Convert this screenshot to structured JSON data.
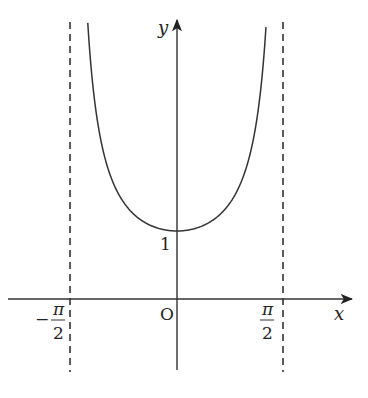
{
  "chart_data": {
    "type": "line",
    "title": "",
    "function": "y = 1/cos(x)",
    "xlabel": "x",
    "ylabel": "y",
    "origin_label": "O",
    "x_ticks": [
      {
        "value": -1.5708,
        "label_num": "π",
        "label_den": "2",
        "sign": "−"
      },
      {
        "value": 1.5708,
        "label_num": "π",
        "label_den": "2",
        "sign": ""
      }
    ],
    "y_ticks": [
      {
        "value": 1,
        "label": "1"
      }
    ],
    "asymptotes": [
      -1.5708,
      1.5708
    ],
    "xlim": [
      -2.5,
      2.6
    ],
    "ylim": [
      -1.05,
      4.1
    ],
    "grid": false,
    "legend": "none",
    "series": [
      {
        "name": "sec x",
        "x": [
          -1.32,
          -1.2,
          -1.0,
          -0.8,
          -0.6,
          -0.4,
          -0.2,
          0,
          0.2,
          0.4,
          0.6,
          0.8,
          1.0,
          1.2,
          1.32
        ],
        "y": [
          4.07,
          2.76,
          1.85,
          1.44,
          1.21,
          1.09,
          1.02,
          1.0,
          1.02,
          1.09,
          1.21,
          1.44,
          1.85,
          2.76,
          4.07
        ]
      }
    ]
  },
  "labels": {
    "x_axis": "x",
    "y_axis": "y",
    "origin": "O",
    "one": "1",
    "pi": "π",
    "two": "2",
    "minus": "−"
  }
}
